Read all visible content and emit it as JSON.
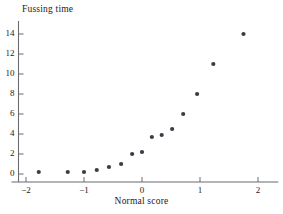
{
  "chart_data": {
    "type": "scatter",
    "title": "",
    "xlabel": "Normal score",
    "ylabel": "Fussing time",
    "xlim": [
      -2.25,
      2.35
    ],
    "ylim": [
      -0.9,
      15.3
    ],
    "xticks": [
      -2,
      -1,
      0,
      1,
      2
    ],
    "xtick_labels": [
      "−2",
      "−1",
      "0",
      "1",
      "2"
    ],
    "yticks": [
      0,
      2,
      4,
      6,
      8,
      10,
      12,
      14
    ],
    "ytick_labels": [
      "0",
      "2",
      "4",
      "6",
      "8",
      "10",
      "12",
      "14"
    ],
    "grid": false,
    "legend": null,
    "marker": {
      "shape": "circle",
      "color": "#3c3c46",
      "size_px": 4.2
    },
    "axis_color": "#6b6b72",
    "points": [
      {
        "x": -1.78,
        "y": 0.2
      },
      {
        "x": -1.28,
        "y": 0.2
      },
      {
        "x": -1.0,
        "y": 0.2
      },
      {
        "x": -0.78,
        "y": 0.4
      },
      {
        "x": -0.57,
        "y": 0.7
      },
      {
        "x": -0.36,
        "y": 1.0
      },
      {
        "x": -0.17,
        "y": 2.0
      },
      {
        "x": 0.0,
        "y": 2.2
      },
      {
        "x": 0.17,
        "y": 3.7
      },
      {
        "x": 0.34,
        "y": 3.9
      },
      {
        "x": 0.52,
        "y": 4.5
      },
      {
        "x": 0.71,
        "y": 6.0
      },
      {
        "x": 0.95,
        "y": 8.0
      },
      {
        "x": 1.23,
        "y": 11.0
      },
      {
        "x": 1.75,
        "y": 14.0
      }
    ]
  },
  "labels": {
    "y_axis_title": "Fussing time",
    "x_axis_title": "Normal score"
  }
}
